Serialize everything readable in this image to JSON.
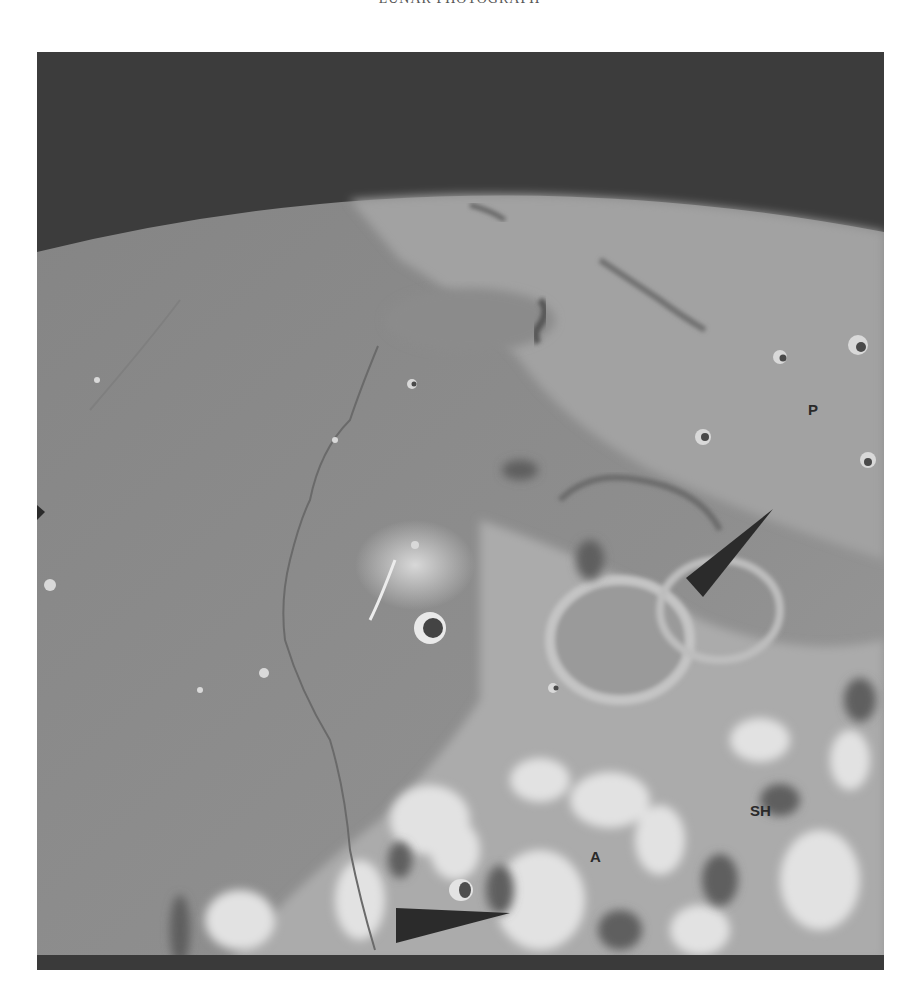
{
  "page": {
    "header_text": "LUNAR PHOTOGRAPH",
    "background": "#ffffff"
  },
  "photo": {
    "description": "Oblique view of the lunar surface with curved horizon, dark sky, mare plain at left and bright cratered highlands at lower right",
    "colors": {
      "sky": "#3c3c3c",
      "mare": "#8a8a8a",
      "highland": "#b8b8b8",
      "bright_ejecta": "#e8e8e8",
      "arrow": "#2b2b2b",
      "bottom_band": "#3a3a3a"
    },
    "labels": [
      {
        "id": "P",
        "text": "P"
      },
      {
        "id": "SH",
        "text": "SH"
      },
      {
        "id": "A",
        "text": "A"
      }
    ],
    "arrows": [
      {
        "id": "upper-arrow",
        "points_to": "crater rim near center-right"
      },
      {
        "id": "lower-arrow",
        "points_to": "crater near bottom center"
      }
    ]
  }
}
